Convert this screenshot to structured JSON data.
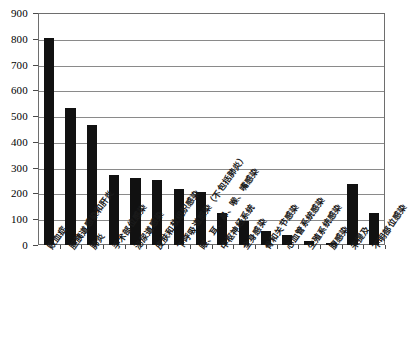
{
  "chart_data": {
    "type": "bar",
    "title": "",
    "subtitle": "",
    "xlabel": "",
    "ylabel": "",
    "ylim": [
      0,
      900
    ],
    "ytick_step": 100,
    "yticks": [
      0,
      100,
      200,
      300,
      400,
      500,
      600,
      700,
      800,
      900
    ],
    "ytick_labels": [
      "0",
      "100",
      "200",
      "300",
      "400",
      "500",
      "600",
      "700",
      "800",
      "900"
    ],
    "grid": true,
    "grid_axis": "y",
    "legend": false,
    "legend_position": "none",
    "bar_color": "#111111",
    "grid_color": "#8a8a8a",
    "frame_color": "#6e6e6e",
    "background_color": "#ffffff",
    "categories": [
      "败血症",
      "胆胰道感染和肝炎",
      "肺炎",
      "手术部位感染",
      "泌尿道感染",
      "皮肤和软组织感染",
      "下呼吸道感染（不包括肺炎）",
      "眼、耳、鼻、喉、嘴感染",
      "中枢神经系统",
      "全身感染",
      "骨和关节感染",
      "心血管系统感染",
      "生殖系统感染",
      "腹感染",
      "未提及",
      "不明部位感染"
    ],
    "values": [
      805,
      530,
      465,
      270,
      260,
      253,
      218,
      205,
      125,
      93,
      55,
      38,
      15,
      7,
      235,
      125
    ]
  }
}
